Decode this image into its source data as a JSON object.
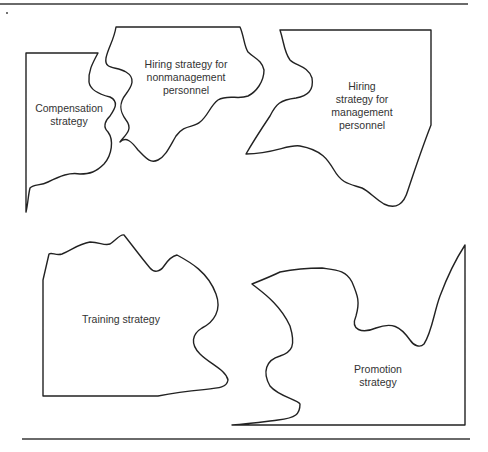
{
  "diagram": {
    "regions": [
      {
        "id": "compensation",
        "label": "Compensation\nstrategy"
      },
      {
        "id": "hiring-nonmanagement",
        "label": "Hiring strategy for\nnonmanagement\npersonnel"
      },
      {
        "id": "hiring-management",
        "label": "Hiring\nstrategy for\nmanagement\npersonnel"
      },
      {
        "id": "training",
        "label": "Training strategy"
      },
      {
        "id": "promotion",
        "label": "Promotion\nstrategy"
      }
    ],
    "colors": {
      "stroke": "#222222",
      "rule": "#6a6a6a",
      "text": "#333333"
    }
  }
}
